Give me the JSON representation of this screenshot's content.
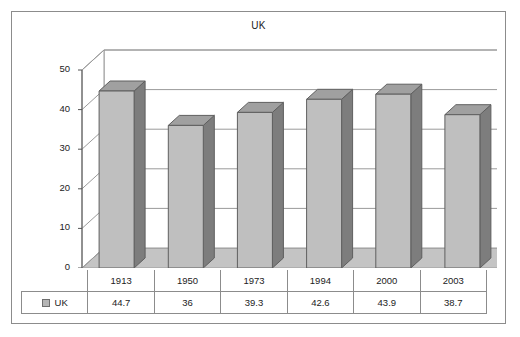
{
  "chart": {
    "title": "UK",
    "legend_label": "UK"
  },
  "axis": {
    "yticks": [
      "50",
      "40",
      "30",
      "20",
      "10",
      "0"
    ]
  },
  "colors": {
    "bar_front": "#bfbfbf",
    "bar_side": "#7d7d7d",
    "bar_top": "#a0a0a0",
    "floor": "#c4c4c4",
    "grid": "#9a9a9a",
    "frame": "#8c8c8c"
  },
  "chart_data": {
    "type": "bar",
    "title": "UK",
    "xlabel": "",
    "ylabel": "",
    "ylim": [
      0,
      50
    ],
    "yticks": [
      0,
      10,
      20,
      30,
      40,
      50
    ],
    "grid": true,
    "legend": [
      "UK"
    ],
    "legend_position": "bottom-left-table",
    "categories": [
      "1913",
      "1950",
      "1973",
      "1994",
      "2000",
      "2003"
    ],
    "series": [
      {
        "name": "UK",
        "values": [
          44.7,
          36,
          39.3,
          42.6,
          43.9,
          38.7
        ],
        "value_labels": [
          "44.7",
          "36",
          "39.3",
          "42.6",
          "43.9",
          "38.7"
        ]
      }
    ]
  }
}
